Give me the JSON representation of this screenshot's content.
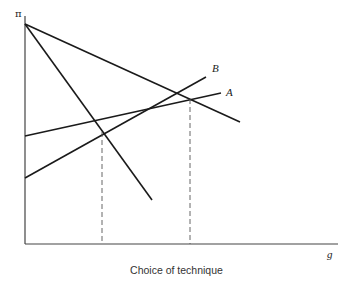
{
  "diagram": {
    "caption": "Choice of technique",
    "y_axis_label": "π",
    "x_axis_label": "g",
    "lines": [
      {
        "id": "A",
        "label": "A",
        "description": "upward-sloping line, lower slope"
      },
      {
        "id": "B",
        "label": "B",
        "description": "upward-sloping line, steeper slope"
      },
      {
        "id": "D1",
        "label": "",
        "description": "downward-sloping line from π-axis intercept, shallow"
      },
      {
        "id": "D2",
        "label": "",
        "description": "downward-sloping line from π-axis intercept, steep"
      }
    ],
    "dashed_guides": 2,
    "colors": {
      "line": "#1a1a1a",
      "axis": "#444444",
      "dashed": "#555555"
    }
  }
}
